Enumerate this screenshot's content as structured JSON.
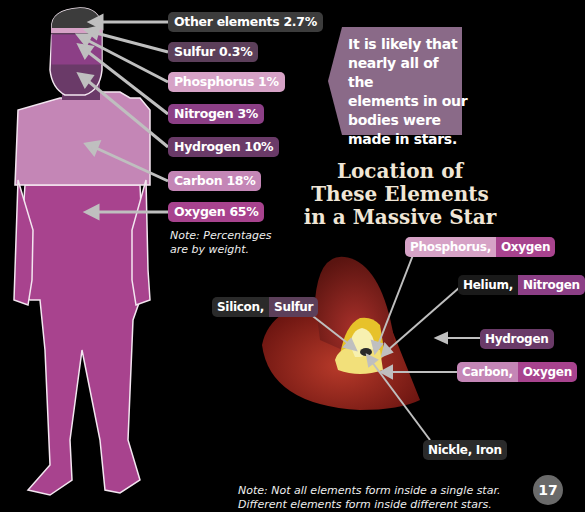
{
  "body_composition": {
    "labels": [
      {
        "name": "Other elements",
        "value": "2.7%",
        "text": "Other elements 2.7%",
        "color": "#3c3c3c"
      },
      {
        "name": "Sulfur",
        "value": "0.3%",
        "text": "Sulfur 0.3%",
        "color": "#5c3f5a"
      },
      {
        "name": "Phosphorus",
        "value": "1%",
        "text": "Phosphorus 1%",
        "color": "#d6a2c6"
      },
      {
        "name": "Nitrogen",
        "value": "3%",
        "text": "Nitrogen 3%",
        "color": "#8c3f86"
      },
      {
        "name": "Hydrogen",
        "value": "10%",
        "text": "Hydrogen 10%",
        "color": "#6a3a68"
      },
      {
        "name": "Carbon",
        "value": "18%",
        "text": "Carbon 18%",
        "color": "#c486b6"
      },
      {
        "name": "Oxygen",
        "value": "65%",
        "text": "Oxygen 65%",
        "color": "#a8438e"
      }
    ],
    "note": "Note: Percentages are by weight.",
    "note_line1": "Note: Percentages",
    "note_line2": "are by weight."
  },
  "callout": {
    "lines": [
      "It is likely that",
      "nearly all of the",
      "elements in our",
      "bodies were",
      "made in stars."
    ],
    "color": "#8a6a88"
  },
  "star_diagram": {
    "title_lines": [
      "Location of",
      "These Elements",
      "in a Massive Star"
    ],
    "labels": [
      {
        "parts": [
          "Phosphorus,",
          "Oxygen"
        ]
      },
      {
        "parts": [
          "Helium,",
          "Nitrogen"
        ]
      },
      {
        "parts": [
          "Silicon,",
          "Sulfur"
        ]
      },
      {
        "parts": [
          "Hydrogen"
        ]
      },
      {
        "parts": [
          "Carbon,",
          "Oxygen"
        ]
      },
      {
        "parts": [
          "Nickle, Iron"
        ]
      }
    ],
    "note_line1": "Note: Not all elements form inside a single star.",
    "note_line2": "Different elements form inside different stars."
  },
  "page_number": "17"
}
